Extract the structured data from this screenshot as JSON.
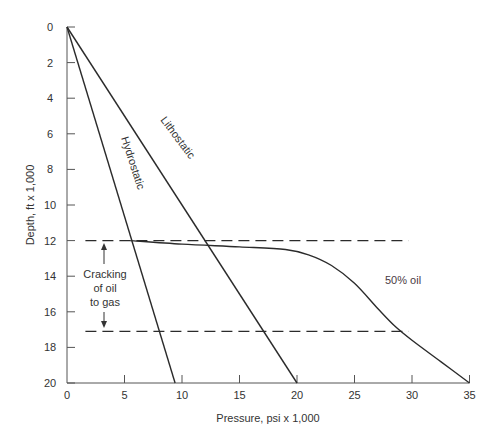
{
  "chart_data": {
    "type": "line",
    "title": "",
    "xlabel": "Pressure, psi x 1,000",
    "ylabel": "Depth, ft x 1,000",
    "xlim": [
      0,
      35
    ],
    "ylim": [
      0,
      20
    ],
    "y_inverted": true,
    "grid": false,
    "legend": "none (inline labels)",
    "x_ticks": [
      "0",
      "5",
      "10",
      "15",
      "20",
      "25",
      "30",
      "35"
    ],
    "y_ticks": [
      "0",
      "2",
      "4",
      "6",
      "8",
      "10",
      "12",
      "14",
      "16",
      "18",
      "20"
    ],
    "series": [
      {
        "name": "Hydrostatic",
        "style": "solid",
        "points": [
          [
            0,
            0
          ],
          [
            9.4,
            20
          ]
        ]
      },
      {
        "name": "Lithostatic",
        "style": "solid",
        "points": [
          [
            0,
            0
          ],
          [
            20,
            20
          ]
        ]
      },
      {
        "name": "50% oil",
        "style": "solid",
        "points": [
          [
            5.5,
            12.0
          ],
          [
            10,
            12.2
          ],
          [
            15,
            12.35
          ],
          [
            19,
            12.5
          ],
          [
            21,
            12.8
          ],
          [
            23,
            13.4
          ],
          [
            25,
            14.4
          ],
          [
            27,
            15.8
          ],
          [
            28.5,
            16.8
          ],
          [
            30,
            17.6
          ],
          [
            32.5,
            18.8
          ],
          [
            35,
            20
          ]
        ]
      },
      {
        "name": "Upper cracking boundary",
        "style": "dashed",
        "points": [
          [
            1.6,
            12
          ],
          [
            29.7,
            12
          ]
        ]
      },
      {
        "name": "Lower cracking boundary",
        "style": "dashed",
        "points": [
          [
            1.6,
            17.1
          ],
          [
            29.7,
            17.1
          ]
        ]
      }
    ],
    "annotations": [
      {
        "text": "Hydrostatic",
        "near": [
          5.3,
          9
        ],
        "rotated": true
      },
      {
        "text": "Lithostatic",
        "near": [
          8.5,
          7.5
        ],
        "rotated": true
      },
      {
        "text": "50% oil",
        "at": [
          25.5,
          14.1
        ]
      },
      {
        "text": "Cracking of oil to gas",
        "at": [
          3.2,
          14.5
        ],
        "arrows": "up to 12, down to 17.1"
      }
    ]
  },
  "labels": {
    "xlabel": "Pressure, psi x 1,000",
    "ylabel": "Depth, ft x 1,000",
    "hydrostatic": "Hydrostatic",
    "lithostatic": "Lithostatic",
    "oil": "50% oil",
    "cracking_line1": "Cracking",
    "cracking_line2": "of oil",
    "cracking_line3": "to gas"
  }
}
